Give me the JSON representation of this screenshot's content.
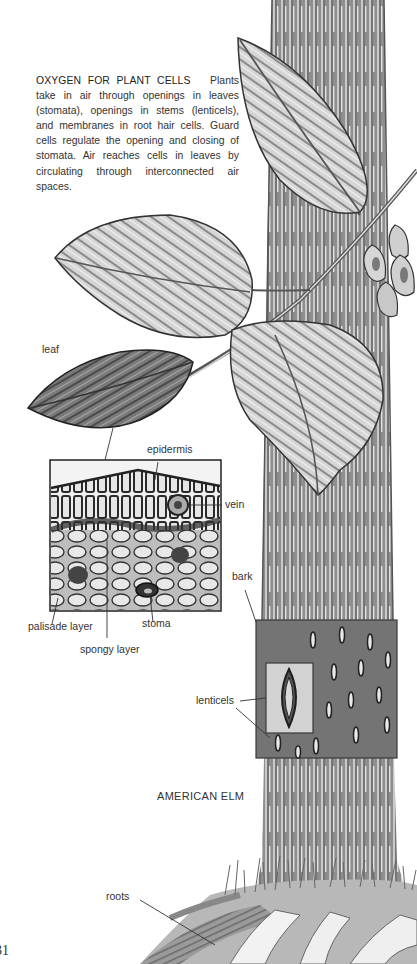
{
  "caption": {
    "title": "OXYGEN FOR PLANT CELLS",
    "body": "Plants take in air through openings in leaves (stomata), openings in stems (lenticels), and membranes in root hair cells. Guard cells regulate the opening and closing of stomata. Air reaches cells in leaves by circulating through interconnected air spaces."
  },
  "labels": {
    "leaf": "leaf",
    "epidermis": "epidermis",
    "vein": "vein",
    "bark": "bark",
    "palisade_layer": "palisade layer",
    "stoma": "stoma",
    "spongy_layer": "spongy layer",
    "lenticels": "lenticels",
    "roots": "roots"
  },
  "tree_name": "AMERICAN ELM",
  "page_number": "31",
  "colors": {
    "trunk": "#8a8a8a",
    "trunk_dark": "#5e5e5e",
    "bark_panel": "#707070",
    "lenticel_inset": "#cfcfcf",
    "leaf_light": "#d8d8d8",
    "leaf_dark": "#6e6e6e",
    "ink": "#2a2a2a"
  }
}
